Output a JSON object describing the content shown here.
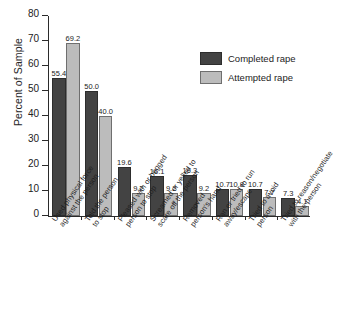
{
  "chart_data": {
    "type": "bar",
    "title": "",
    "subtitle": "",
    "xlabel": "",
    "ylabel": "Percent of Sample",
    "ylim": [
      0,
      80
    ],
    "ytick_step": 10,
    "yticks": [
      "0",
      "10",
      "20",
      "30",
      "40",
      "50",
      "60",
      "70",
      "80"
    ],
    "grid": false,
    "legend_position": "upper right",
    "categories": [
      "Used physical force against the person",
      "Told the person to stop",
      "Pleased with or begged person to stop",
      "Screamed or yelled to scare off the person",
      "Removed person's hand",
      "Ran or tried to run away/escape",
      "Tried to avoid person",
      "Tried to reason/negotiate with the person"
    ],
    "category_lines": [
      [
        "Used physical force",
        "against the person"
      ],
      [
        "Told the person",
        "to stop"
      ],
      [
        "Pleased with or begged",
        "person to stop"
      ],
      [
        "Screamed or yelled to",
        "scare off the person"
      ],
      [
        "Removed",
        "person's hand"
      ],
      [
        "Ran or tried to run",
        "away/escape"
      ],
      [
        "Tried to avoid",
        "person"
      ],
      [
        "Tried to reason/negotiate",
        "with the person"
      ]
    ],
    "series": [
      {
        "name": "Completed rape",
        "color": "#434343",
        "values": [
          55.4,
          50.0,
          19.6,
          16.1,
          16.3,
          10.7,
          10.7,
          7.3
        ],
        "labels": [
          "55.4",
          "50.0",
          "19.6",
          "16.1",
          "16.3",
          "10.7",
          "10.7",
          "7.3"
        ]
      },
      {
        "name": "Attempted rape",
        "color": "#bcbcbc",
        "values": [
          69.2,
          40.0,
          9.2,
          9.2,
          9.2,
          10.8,
          7.7,
          4.1
        ],
        "labels": [
          "69.2",
          "40.0",
          "9.2",
          "9.2",
          "9.2",
          "10.8",
          "7.7",
          "4.1"
        ]
      }
    ]
  },
  "legend": {
    "entries": [
      {
        "label": "Completed rape",
        "color": "#434343"
      },
      {
        "label": "Attempted rape",
        "color": "#bcbcbc"
      }
    ]
  },
  "axes": {
    "y_title": "Percent of Sample"
  }
}
